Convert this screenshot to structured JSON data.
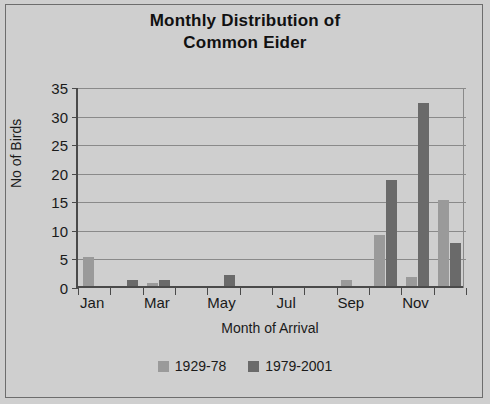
{
  "chart_data": {
    "type": "bar",
    "title": "Monthly Distribution of Common Eider",
    "title_line1": "Monthly Distribution of",
    "title_line2": "Common Eider",
    "xlabel": "Month of Arrival",
    "ylabel": "No of Birds",
    "ylim": [
      0,
      35
    ],
    "yticks": [
      0,
      5,
      10,
      15,
      20,
      25,
      30,
      35
    ],
    "ytick_labels": [
      "0",
      "5",
      "10",
      "15",
      "20",
      "25",
      "30",
      "35"
    ],
    "grid": true,
    "legend_position": "bottom",
    "categories": [
      "Jan",
      "Feb",
      "Mar",
      "Apr",
      "May",
      "Jun",
      "Jul",
      "Aug",
      "Sep",
      "Oct",
      "Nov",
      "Dec"
    ],
    "xtick_labels": [
      "Jan",
      "",
      "Mar",
      "",
      "May",
      "",
      "Jul",
      "",
      "Sep",
      "",
      "Nov",
      ""
    ],
    "visible_xtick_labels": [
      "Jan",
      "Mar",
      "May",
      "Jul",
      "Sep",
      "Nov"
    ],
    "series": [
      {
        "name": "1929-78",
        "color": "#9a9a9a",
        "values": [
          5,
          0,
          0.5,
          0,
          0,
          0,
          0,
          0,
          1,
          9,
          1.5,
          15
        ]
      },
      {
        "name": "1979-2001",
        "color": "#6a6a6a",
        "values": [
          0,
          1,
          1,
          0,
          2,
          0,
          0,
          0,
          0,
          18.5,
          32,
          7.5
        ]
      }
    ]
  },
  "legend": {
    "items": [
      {
        "label": "1929-78",
        "color": "#9a9a9a"
      },
      {
        "label": "1979-2001",
        "color": "#6a6a6a"
      }
    ]
  },
  "colors": {
    "background": "#cfcfcf",
    "frame": "#6d6d6d",
    "axis": "#4a4a4a",
    "gridline": "#8a8a8a",
    "text": "#1a1a1a",
    "series_1929_78": "#9a9a9a",
    "series_1979_2001": "#6a6a6a"
  }
}
